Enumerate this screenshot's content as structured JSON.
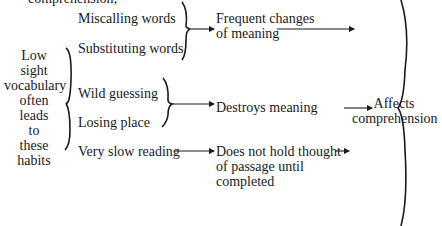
{
  "cut_top_text": "comprehension;",
  "cause": [
    "Low",
    "sight",
    "vocabulary",
    "often",
    "leads",
    "to",
    "these",
    "habits"
  ],
  "habits": [
    "Miscalling words",
    "Substituting words",
    "Wild guessing",
    "Losing place",
    "Very slow reading"
  ],
  "effects": [
    [
      "Frequent changes",
      "of meaning"
    ],
    [
      "Destroys meaning"
    ],
    [
      "Does not hold thought",
      "of passage until",
      "completed"
    ]
  ],
  "result": [
    "Affects",
    "comprehension"
  ]
}
